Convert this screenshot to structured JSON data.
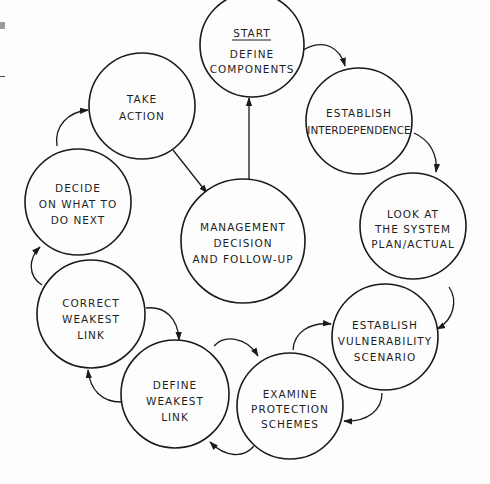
{
  "diagram": {
    "type": "cycle",
    "center": {
      "id": "management",
      "lines": [
        "MANAGEMENT",
        "DECISION",
        "AND FOLLOW-UP"
      ]
    },
    "nodes": [
      {
        "id": "start",
        "label_top": "START",
        "lines": [
          "DEFINE",
          "COMPONENTS"
        ]
      },
      {
        "id": "interdependence",
        "lines": [
          "ESTABLISH",
          "INTERDEPENDENCE"
        ]
      },
      {
        "id": "look",
        "lines": [
          "LOOK AT",
          "THE SYSTEM",
          "PLAN/ACTUAL"
        ]
      },
      {
        "id": "vulnerability",
        "lines": [
          "ESTABLISH",
          "VULNERABILITY",
          "SCENARIO"
        ]
      },
      {
        "id": "examine",
        "lines": [
          "EXAMINE",
          "PROTECTION",
          "SCHEMES"
        ]
      },
      {
        "id": "define-weakest",
        "lines": [
          "DEFINE",
          "WEAKEST",
          "LINK"
        ]
      },
      {
        "id": "correct-weakest",
        "lines": [
          "CORRECT",
          "WEAKEST",
          "LINK"
        ]
      },
      {
        "id": "decide",
        "lines": [
          "DECIDE",
          "ON WHAT TO",
          "DO NEXT"
        ]
      },
      {
        "id": "take-action",
        "lines": [
          "TAKE",
          "ACTION"
        ]
      }
    ],
    "edges": [
      {
        "from": "start",
        "to": "interdependence"
      },
      {
        "from": "interdependence",
        "to": "look"
      },
      {
        "from": "look",
        "to": "vulnerability"
      },
      {
        "from": "vulnerability",
        "to": "examine"
      },
      {
        "from": "examine",
        "to": "vulnerability"
      },
      {
        "from": "examine",
        "to": "define-weakest"
      },
      {
        "from": "define-weakest",
        "to": "examine"
      },
      {
        "from": "define-weakest",
        "to": "correct-weakest"
      },
      {
        "from": "correct-weakest",
        "to": "define-weakest"
      },
      {
        "from": "correct-weakest",
        "to": "decide"
      },
      {
        "from": "decide",
        "to": "take-action"
      },
      {
        "from": "take-action",
        "to": "management"
      },
      {
        "from": "management",
        "to": "start"
      }
    ]
  }
}
